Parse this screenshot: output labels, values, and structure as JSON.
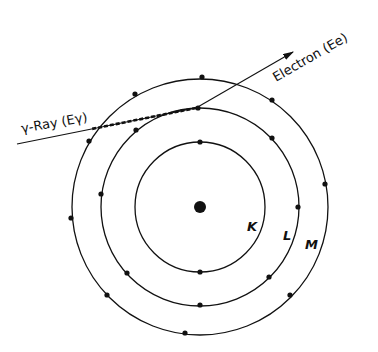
{
  "diagram": {
    "title": "",
    "nucleus": {
      "cx": 200,
      "cy": 207,
      "r": 6
    },
    "shells": [
      {
        "label": "K",
        "r": 65,
        "label_x": 243,
        "label_y": 230,
        "electrons": [
          [
            200,
            142
          ],
          [
            200,
            272
          ]
        ]
      },
      {
        "label": "L",
        "r": 99,
        "label_x": 283,
        "label_y": 238,
        "electrons": [
          [
            198,
            108
          ],
          [
            136,
            130
          ],
          [
            272,
            138
          ],
          [
            101,
            194
          ],
          [
            298,
            207
          ],
          [
            127,
            273
          ],
          [
            269,
            277
          ],
          [
            200,
            305
          ]
        ]
      },
      {
        "label": "M",
        "r": 128,
        "label_x": 305,
        "label_y": 247,
        "electrons": [
          [
            202,
            77
          ],
          [
            135,
            94
          ],
          [
            272,
            100
          ],
          [
            89,
            141
          ],
          [
            325,
            184
          ],
          [
            71,
            218
          ],
          [
            107,
            295
          ],
          [
            290,
            295
          ],
          [
            185,
            333
          ]
        ]
      }
    ],
    "gamma_ray": {
      "label": "γ-Ray (Eγ)",
      "x1": 17,
      "y1": 144,
      "x2": 196,
      "y2": 108
    },
    "electron_out": {
      "label": "Electron (Ee)",
      "x1": 196,
      "y1": 108,
      "x2": 293,
      "y2": 52
    }
  },
  "labels": {
    "gamma": "γ-Ray (Eγ)",
    "electron": "Electron (Ee)",
    "K": "K",
    "L": "L",
    "M": "M"
  }
}
